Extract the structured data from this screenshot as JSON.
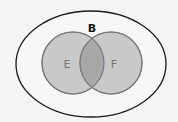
{
  "diagram": {
    "type": "venn",
    "universe": {
      "label": "B",
      "cx": 91,
      "cy": 64,
      "rx": 75,
      "ry": 53
    },
    "sets": [
      {
        "label": "E",
        "cx": 73,
        "cy": 63,
        "r": 31
      },
      {
        "label": "F",
        "cx": 111,
        "cy": 63,
        "r": 31
      }
    ],
    "colors": {
      "background": "#f4f4f4",
      "universe_stroke": "#1a1a1a",
      "set_fill": "#c8c8c8",
      "set_stroke": "#7a7a7a",
      "overlap_fill": "#a9a9a9",
      "label_universe": "#111111",
      "label_sets": "#777777"
    }
  }
}
